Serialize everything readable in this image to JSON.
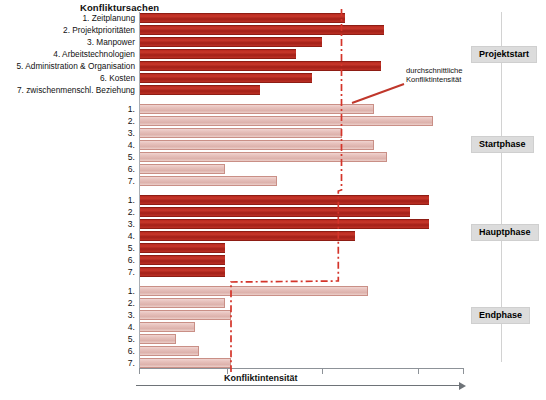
{
  "chart_data": {
    "type": "bar",
    "title": "Konfliktursachen",
    "xlabel": "Konfliktintensität",
    "ylabel": "",
    "orientation": "horizontal",
    "grid": false,
    "xlim": [
      0,
      100
    ],
    "legend_position": "none",
    "annotation": {
      "line1": "durchschnittliche",
      "line2": "Konfliktintensität"
    },
    "categories": [
      "1. Zeitplanung",
      "2. Projektprioritäten",
      "3. Manpower",
      "4. Arbeitstechnologien",
      "5. Administration & Organisation",
      "6. Kosten",
      "7. zwischenmenschl. Beziehung"
    ],
    "short_categories": [
      "1.",
      "2.",
      "3.",
      "4.",
      "5.",
      "6.",
      "7."
    ],
    "groups": [
      {
        "name": "Projektstart",
        "style": "dark",
        "values": [
          63,
          75,
          56,
          48,
          74,
          53,
          37
        ],
        "average": 62
      },
      {
        "name": "Startphase",
        "style": "light",
        "values": [
          72,
          90,
          62,
          72,
          76,
          26,
          42
        ],
        "average": 62
      },
      {
        "name": "Hauptphase",
        "style": "dark",
        "values": [
          89,
          83,
          89,
          66,
          26,
          26,
          26
        ],
        "average": 61
      },
      {
        "name": "Endphase",
        "style": "light",
        "values": [
          70,
          26,
          28,
          17,
          11,
          18,
          28
        ],
        "average": 28
      }
    ],
    "intensity_series_label": "durchschnittliche Konfliktintensität",
    "intensity_points": [
      62,
      62,
      61,
      28
    ]
  },
  "axis": {
    "tick_count": 4
  }
}
